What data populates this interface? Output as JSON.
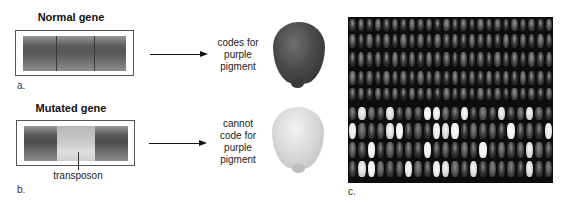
{
  "panel_a": {
    "title": "Normal gene",
    "label": "a.",
    "caption_lines": [
      "codes for",
      "purple",
      "pigment"
    ],
    "kernel": "purple-kernel"
  },
  "panel_b": {
    "title": "Mutated gene",
    "label": "b.",
    "insert_label": "transposon",
    "caption_lines": [
      "cannot",
      "code for",
      "purple",
      "pigment"
    ],
    "kernel": "white-kernel"
  },
  "panel_c": {
    "label": "c.",
    "photo": "corn-ear-photo",
    "description": "Corn ear: upper rows purple kernels, lower rows mixed purple and white kernels"
  },
  "colors": {
    "text": "#222222",
    "box_border": "#555555",
    "arrow": "#111111",
    "photo_bg": "#0d0d0d"
  }
}
